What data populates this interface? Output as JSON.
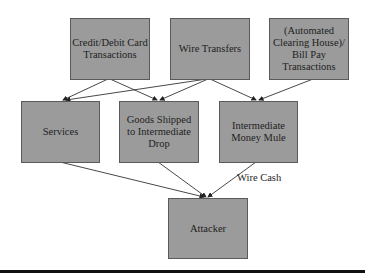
{
  "diagram": {
    "nodes": [
      {
        "id": "credit",
        "label": "Credit/Debit Card\nTransactions"
      },
      {
        "id": "wire",
        "label": "Wire Transfers"
      },
      {
        "id": "ach",
        "label": "(Automated\nClearing House)/\nBill Pay\nTransactions"
      },
      {
        "id": "services",
        "label": "Services"
      },
      {
        "id": "goods",
        "label": "Goods Shipped\nto Intermediate\nDrop"
      },
      {
        "id": "mule",
        "label": "Intermediate\nMoney Mule"
      },
      {
        "id": "attacker",
        "label": "Attacker"
      }
    ],
    "edges": [
      {
        "from": "credit",
        "to": "services"
      },
      {
        "from": "credit",
        "to": "goods"
      },
      {
        "from": "wire",
        "to": "services"
      },
      {
        "from": "wire",
        "to": "goods"
      },
      {
        "from": "wire",
        "to": "mule"
      },
      {
        "from": "ach",
        "to": "mule"
      },
      {
        "from": "services",
        "to": "attacker"
      },
      {
        "from": "goods",
        "to": "attacker"
      },
      {
        "from": "mule",
        "to": "attacker",
        "label": "Wire Cash"
      }
    ],
    "edge_label": "Wire Cash",
    "colors": {
      "box_fill": "#9b9b9b",
      "box_border": "#5a5a5a",
      "line": "#333333"
    }
  }
}
